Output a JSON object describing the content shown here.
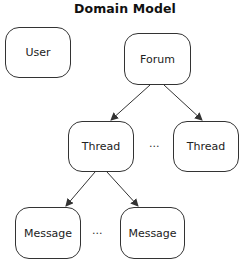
{
  "title": "Domain Model",
  "nodes": {
    "user": {
      "label": "User"
    },
    "forum": {
      "label": "Forum"
    },
    "thread_1": {
      "label": "Thread"
    },
    "thread_2": {
      "label": "Thread"
    },
    "message_1": {
      "label": "Message"
    },
    "message_2": {
      "label": "Message"
    }
  },
  "ellipsis": {
    "threads": "...",
    "messages": "..."
  },
  "edges": [
    {
      "from": "Forum",
      "to": "Thread"
    },
    {
      "from": "Forum",
      "to": "Thread"
    },
    {
      "from": "Thread",
      "to": "Message"
    },
    {
      "from": "Thread",
      "to": "Message"
    }
  ]
}
